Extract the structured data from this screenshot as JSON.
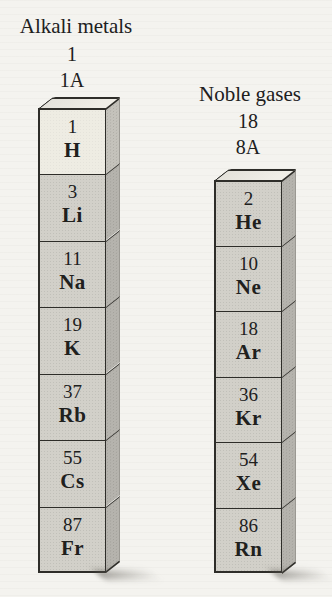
{
  "groups": [
    {
      "title": "Alkali metals",
      "group_number": "1",
      "group_label": "1A",
      "cells": [
        {
          "number": "1",
          "symbol": "H"
        },
        {
          "number": "3",
          "symbol": "Li"
        },
        {
          "number": "11",
          "symbol": "Na"
        },
        {
          "number": "19",
          "symbol": "K"
        },
        {
          "number": "37",
          "symbol": "Rb"
        },
        {
          "number": "55",
          "symbol": "Cs"
        },
        {
          "number": "87",
          "symbol": "Fr"
        }
      ]
    },
    {
      "title": "Noble gases",
      "group_number": "18",
      "group_label": "8A",
      "cells": [
        {
          "number": "2",
          "symbol": "He"
        },
        {
          "number": "10",
          "symbol": "Ne"
        },
        {
          "number": "18",
          "symbol": "Ar"
        },
        {
          "number": "36",
          "symbol": "Kr"
        },
        {
          "number": "54",
          "symbol": "Xe"
        },
        {
          "number": "86",
          "symbol": "Rn"
        }
      ]
    }
  ],
  "colors": {
    "bg": "#f4f3ef",
    "cell_front": "#d2d0c9",
    "cell_front_light": "#eeece3",
    "cell_side": "#b6b4ae",
    "cell_side_light": "#c5c3bc",
    "cell_top": "#e4e2db",
    "line": "#2e2d29",
    "back_edge": "#9b9993",
    "text": "#20201d"
  }
}
